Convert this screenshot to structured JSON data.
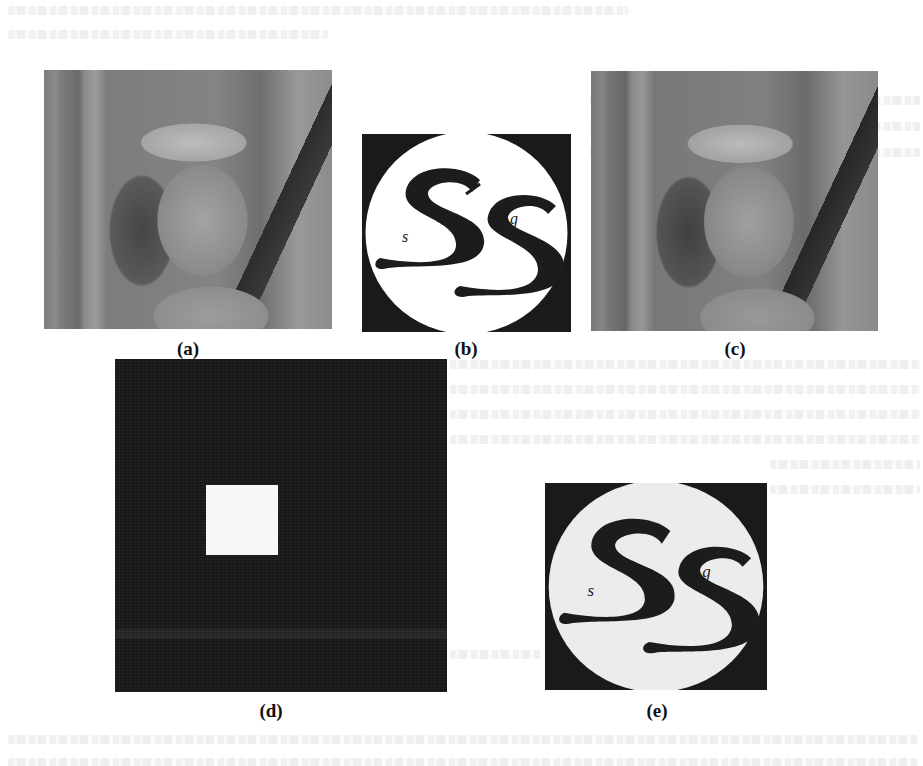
{
  "figure": {
    "panels": [
      {
        "id": "a",
        "label": "(a)",
        "description": "Original Lena host image (grayscale)"
      },
      {
        "id": "b",
        "label": "(b)",
        "description": "Original watermark logo: two stylized S letters with small 's' and 'g' inside a white circle on black background"
      },
      {
        "id": "c",
        "label": "(c)",
        "description": "Watermarked Lena image"
      },
      {
        "id": "d",
        "label": "(d)",
        "description": "Dark noise-like image with a single white square"
      },
      {
        "id": "e",
        "label": "(e)",
        "description": "Extracted watermark logo, slightly noisy"
      }
    ],
    "logo": {
      "small_left_letter": "s",
      "small_right_letter": "g"
    }
  },
  "colors": {
    "page_background": "#ffffff",
    "logo_background": "#1a1a1a",
    "logo_circle": "#ffffff",
    "extracted_logo_circle": "#e8e8e8",
    "spatial_dark": "#181818",
    "spatial_square": "#f7f7f7"
  }
}
